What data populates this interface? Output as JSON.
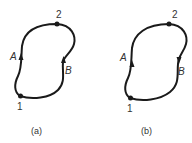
{
  "figure": {
    "panels": [
      {
        "id": "a",
        "caption": "(a)",
        "points": [
          {
            "label": "1"
          },
          {
            "label": "2"
          }
        ],
        "paths": [
          {
            "label": "A",
            "direction": "1 to 2"
          },
          {
            "label": "B",
            "direction": "1 to 2"
          }
        ]
      },
      {
        "id": "b",
        "caption": "(b)",
        "points": [
          {
            "label": "1"
          },
          {
            "label": "2"
          }
        ],
        "paths": [
          {
            "label": "A",
            "direction": "1 to 2"
          },
          {
            "label": "B",
            "direction": "2 to 1"
          }
        ]
      }
    ],
    "colors": {
      "stroke": "#1a1a1a",
      "text": "#333333"
    }
  }
}
